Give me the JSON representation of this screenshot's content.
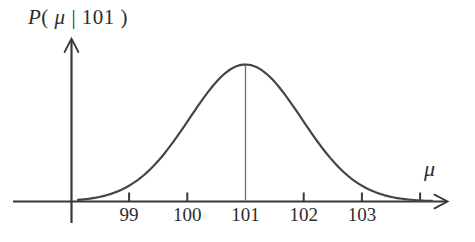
{
  "figure": {
    "title": {
      "p": "P",
      "open": "( ",
      "mu": "μ",
      "bar": " | ",
      "value": "101",
      "close": " )"
    },
    "x_label": "μ"
  },
  "colors": {
    "ink": "#2d2d2d",
    "curve": "#454545",
    "axis": "#383838",
    "mean_line": "#6e6e6e",
    "background": "#ffffff"
  },
  "chart_data": {
    "type": "line",
    "curve": "gaussian",
    "title": "P( μ | 101 )",
    "ylabel": "P( μ | 101 )",
    "xlabel": "μ",
    "mean": 101,
    "sigma": 1,
    "peak_at_mean": true,
    "x_range": [
      98.2,
      104.5
    ],
    "grid": false,
    "x_ticks": [
      {
        "value": 99,
        "label": "99"
      },
      {
        "value": 100,
        "label": "100"
      },
      {
        "value": 101,
        "label": "101",
        "mean_line": true
      },
      {
        "value": 102,
        "label": "102"
      },
      {
        "value": 103,
        "label": "103"
      },
      {
        "value": 104,
        "label": ""
      }
    ],
    "annotations": [
      "thin vertical line from curve peak down to axis at μ = 101"
    ]
  }
}
